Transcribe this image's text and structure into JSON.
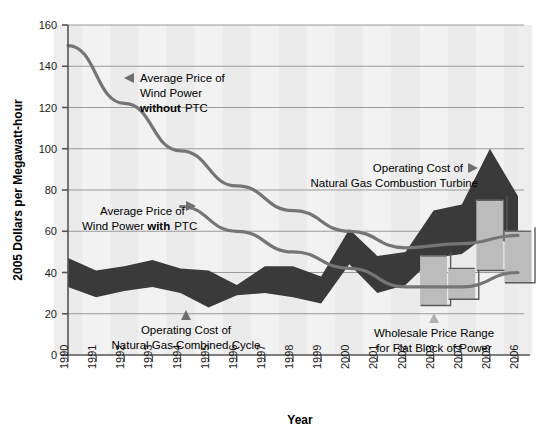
{
  "chart_data": {
    "type": "area",
    "title": "",
    "xlabel": "Year",
    "ylabel": "2005 Dollars per Megawatt-hour",
    "xlim": [
      1990,
      2006
    ],
    "ylim": [
      0,
      160
    ],
    "ytick_step": 20,
    "grid": true,
    "legend_position": "inline-annotations",
    "yticks": [
      "0",
      "20",
      "40",
      "60",
      "80",
      "100",
      "120",
      "140",
      "160"
    ],
    "categories": [
      "1990",
      "1991",
      "1992",
      "1993",
      "1994",
      "1995",
      "1996",
      "1997",
      "1998",
      "1999",
      "2000",
      "2001",
      "2002",
      "2003",
      "2004",
      "2005",
      "2006"
    ],
    "series": [
      {
        "name": "Operating Cost of Natural Gas Combined Cycle",
        "type": "band",
        "color": "#3a3a3a",
        "upper": [
          47,
          41,
          43,
          46,
          42,
          41,
          34,
          43,
          43,
          38,
          61,
          48,
          50,
          70,
          73,
          100,
          77
        ],
        "lower": [
          33,
          28,
          31,
          33,
          30,
          23,
          29,
          30,
          28,
          25,
          44,
          30,
          34,
          47,
          49,
          59,
          51
        ]
      },
      {
        "name": "Average Price of Wind Power without PTC",
        "type": "line",
        "color": "#757575",
        "x": [
          1990,
          1992,
          1994,
          1996,
          1998,
          2000,
          2002,
          2004,
          2006
        ],
        "values": [
          150,
          122,
          99,
          82,
          70,
          60,
          52,
          54,
          58
        ]
      },
      {
        "name": "Average Price of Wind Power with PTC",
        "type": "line",
        "color": "#757575",
        "x": [
          1994,
          1996,
          1998,
          2000,
          2002,
          2004,
          2006
        ],
        "values": [
          72,
          60,
          50,
          42,
          33,
          33,
          40
        ]
      },
      {
        "name": "Wholesale Price Range for Flat Block of Power",
        "type": "range-bars",
        "color": "#bcbcbc",
        "x": [
          2003,
          2004,
          2005,
          2006
        ],
        "low": [
          24,
          27,
          41,
          35
        ],
        "high": [
          48,
          42,
          75,
          60
        ]
      }
    ],
    "annotations": [
      {
        "id": "wind-without-ptc",
        "lines": [
          "Average Price of",
          "Wind Power",
          "without PTC"
        ],
        "bold_word": "without",
        "marker": "left-triangle"
      },
      {
        "id": "wind-with-ptc",
        "lines": [
          "Average Price of",
          "Wind Power with PTC"
        ],
        "bold_word": "with",
        "marker": "right-triangle"
      },
      {
        "id": "gas-combined-cycle",
        "lines": [
          "Operating Cost of",
          "Natural Gas Combined Cycle"
        ],
        "marker": "up-triangle"
      },
      {
        "id": "gas-combustion-turbine",
        "lines": [
          "Operating Cost of",
          "Natural Gas Combustion Turbine"
        ],
        "marker": "right-triangle"
      },
      {
        "id": "wholesale-price-range",
        "lines": [
          "Wholesale Price Range",
          "for Flat Block of Power"
        ],
        "marker": "up-triangle"
      }
    ],
    "colors": {
      "band_dark": "#3a3a3a",
      "line_gray": "#757575",
      "range_bar": "#bcbcbc",
      "range_bar_edge": "#5a5a5a",
      "grid": "#9a9a9a",
      "axis": "#555555",
      "plot_bg": "#f2f2f2",
      "plot_band": "#e8e8e8"
    }
  }
}
